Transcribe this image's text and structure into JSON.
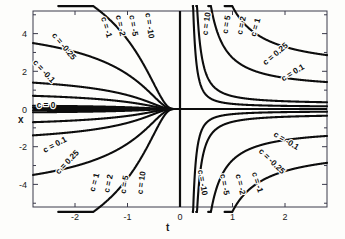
{
  "chart_data": {
    "type": "line",
    "title": "",
    "xlabel": "t",
    "ylabel": "x",
    "xlim": [
      -2.8,
      2.8
    ],
    "ylim": [
      -5.2,
      5.2
    ],
    "grid": false,
    "legend": "inline-curve-labels",
    "xticks": [
      -2,
      -1,
      0,
      1,
      2
    ],
    "xticklabels": [
      "-2",
      "-1",
      "0",
      "1",
      "2"
    ],
    "yticks": [
      -4,
      -2,
      0,
      2,
      4
    ],
    "yticklabels": [
      "-4",
      "-2",
      "0",
      "2",
      "4"
    ],
    "equation": "x = c*exp(1/t)",
    "series": [
      {
        "name": "c = 0",
        "c": 0,
        "label": "c = 0",
        "quadrant": "axis"
      },
      {
        "name": "c = -0.1",
        "c": -0.1,
        "label": "c = -0.1",
        "quadrant": "upper-left"
      },
      {
        "name": "c = -0.25",
        "c": -0.25,
        "label": "c = -0.25",
        "quadrant": "upper-left"
      },
      {
        "name": "c = -1",
        "c": -1,
        "label": "c = -1",
        "quadrant": "upper-left"
      },
      {
        "name": "c = -2",
        "c": -2,
        "label": "c = -2",
        "quadrant": "upper-left"
      },
      {
        "name": "c = -5",
        "c": -5,
        "label": "c = -5",
        "quadrant": "upper-left"
      },
      {
        "name": "c = -10",
        "c": -10,
        "label": "c = -10",
        "quadrant": "upper-left"
      },
      {
        "name": "c = 10",
        "c": 10,
        "label": "c = 10",
        "quadrant": "upper-right"
      },
      {
        "name": "c = 5",
        "c": 5,
        "label": "c = 5",
        "quadrant": "upper-right"
      },
      {
        "name": "c = 2",
        "c": 2,
        "label": "c = 2",
        "quadrant": "upper-right"
      },
      {
        "name": "c = 1",
        "c": 1,
        "label": "c = 1",
        "quadrant": "upper-right"
      },
      {
        "name": "c = 0.25",
        "c": 0.25,
        "label": "c = 0.25",
        "quadrant": "upper-right"
      },
      {
        "name": "c = 0.1",
        "c": 0.1,
        "label": "c = 0.1",
        "quadrant": "upper-right"
      },
      {
        "name": "c = 0.1 lower",
        "c": 0.1,
        "label": "c = 0.1",
        "quadrant": "lower-left"
      },
      {
        "name": "c = 0.25 lower",
        "c": 0.25,
        "label": "c = 0.25",
        "quadrant": "lower-left"
      },
      {
        "name": "c = 1 lower",
        "c": 1,
        "label": "c = 1",
        "quadrant": "lower-left"
      },
      {
        "name": "c = 2 lower",
        "c": 2,
        "label": "c = 2",
        "quadrant": "lower-left"
      },
      {
        "name": "c = 5 lower",
        "c": 5,
        "label": "c = 5",
        "quadrant": "lower-left"
      },
      {
        "name": "c = 10 lower",
        "c": 10,
        "label": "c = 10",
        "quadrant": "lower-left"
      },
      {
        "name": "c = -10 lower",
        "c": -10,
        "label": "c = -10",
        "quadrant": "lower-right"
      },
      {
        "name": "c = -5 lower",
        "c": -5,
        "label": "c = -5",
        "quadrant": "lower-right"
      },
      {
        "name": "c = -2 lower",
        "c": -2,
        "label": "c = -2",
        "quadrant": "lower-right"
      },
      {
        "name": "c = -1 lower",
        "c": -1,
        "label": "c = -1",
        "quadrant": "lower-right"
      },
      {
        "name": "c = -0.25 lower",
        "c": -0.25,
        "label": "c = -0.25",
        "quadrant": "lower-right"
      },
      {
        "name": "c = -0.1 lower",
        "c": -0.1,
        "label": "c = -0.1",
        "quadrant": "lower-right"
      }
    ],
    "curve_labels": [
      {
        "text": "c = 0",
        "x": 46,
        "y": 108,
        "rot": 0
      },
      {
        "text": "c = -0.1",
        "x": 42,
        "y": 73,
        "rot": 47
      },
      {
        "text": "c = -0.25",
        "x": 62,
        "y": 48,
        "rot": 50
      },
      {
        "text": "c = -1",
        "x": 104,
        "y": 28,
        "rot": 74
      },
      {
        "text": "c = -2",
        "x": 118,
        "y": 26,
        "rot": 78
      },
      {
        "text": "c = -5",
        "x": 131,
        "y": 26,
        "rot": 80
      },
      {
        "text": "c = -10",
        "x": 147,
        "y": 26,
        "rot": 82
      },
      {
        "text": "c = 10",
        "x": 209,
        "y": 24,
        "rot": -82
      },
      {
        "text": "c = 5",
        "x": 229,
        "y": 25,
        "rot": -80
      },
      {
        "text": "c = 2",
        "x": 244,
        "y": 26,
        "rot": -78
      },
      {
        "text": "c = 1",
        "x": 258,
        "y": 28,
        "rot": -74
      },
      {
        "text": "c = 0.25",
        "x": 277,
        "y": 56,
        "rot": -40
      },
      {
        "text": "c = 0.1",
        "x": 294,
        "y": 75,
        "rot": -31
      },
      {
        "text": "c = 0.1",
        "x": 56,
        "y": 147,
        "rot": -28
      },
      {
        "text": "c = 0.25",
        "x": 69,
        "y": 164,
        "rot": -46
      },
      {
        "text": "c = 1",
        "x": 97,
        "y": 183,
        "rot": -75
      },
      {
        "text": "c = 2",
        "x": 111,
        "y": 184,
        "rot": -78
      },
      {
        "text": "c = 5",
        "x": 127,
        "y": 185,
        "rot": -80
      },
      {
        "text": "c = 10",
        "x": 144,
        "y": 183,
        "rot": -82
      },
      {
        "text": "c = -10",
        "x": 200,
        "y": 183,
        "rot": 80
      },
      {
        "text": "c = -5",
        "x": 222,
        "y": 185,
        "rot": 79
      },
      {
        "text": "c = -2",
        "x": 238,
        "y": 185,
        "rot": 77
      },
      {
        "text": "c = -1",
        "x": 255,
        "y": 183,
        "rot": 72
      },
      {
        "text": "c = -0.25",
        "x": 270,
        "y": 163,
        "rot": 44
      },
      {
        "text": "c = -0.1",
        "x": 285,
        "y": 143,
        "rot": 31
      }
    ]
  },
  "axes": {
    "xlabel": "t",
    "ylabel": "x"
  }
}
